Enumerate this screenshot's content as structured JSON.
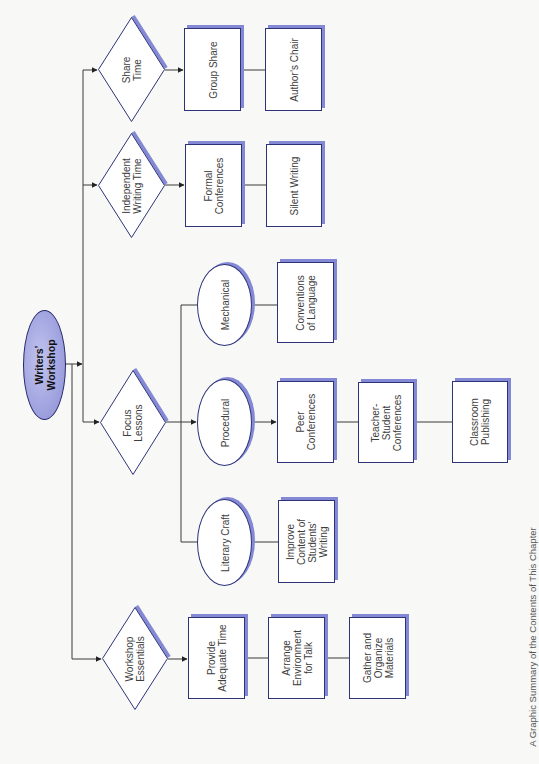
{
  "diagram": {
    "root": {
      "label": "Writers’\nWorkshop"
    },
    "branches": {
      "share_time": {
        "label": "Share\nTime",
        "items": [
          "Group Share",
          "Author’s Chair"
        ]
      },
      "independent_writing_time": {
        "label": "Independent\nWriting Time",
        "items": [
          "Formal\nConferences",
          "Silent Writing"
        ]
      },
      "focus_lessons": {
        "label": "Focus\nLessons",
        "types": {
          "mechanical": {
            "label": "Mechanical",
            "items": [
              "Conventions\nof Language"
            ]
          },
          "procedural": {
            "label": "Procedural",
            "items": [
              "Peer\nConferences",
              "Teacher-\nStudent\nConferences",
              "Classroom\nPublishing"
            ]
          },
          "literary_craft": {
            "label": "Literary Craft",
            "items": [
              "Improve\nContent of\nStudents’\nWriting"
            ]
          }
        }
      },
      "workshop_essentials": {
        "label": "Workshop\nEssentials",
        "items": [
          "Provide\nAdequate Time",
          "Arrange\nEnvironment\nfor Talk",
          "Gather and\nOrganize\nMaterials"
        ]
      }
    }
  },
  "caption": "A Graphic Summary of the Contents of This Chapter",
  "colors": {
    "outline": "#2e3378",
    "shadow": "#8489d6",
    "root_fill": "#a3a6e0",
    "connector": "#333333",
    "text": "#3d3d3d"
  }
}
